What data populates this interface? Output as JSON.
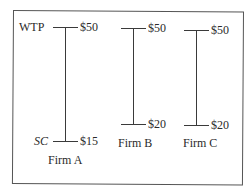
{
  "diagram": {
    "type": "willingness-to-pay-vs-supplier-cost",
    "axis_labels": {
      "top": "WTP",
      "bottom": "SC"
    },
    "firms": [
      {
        "name": "Firm A",
        "wtp": "$50",
        "sc": "$15"
      },
      {
        "name": "Firm B",
        "wtp": "$50",
        "sc": "$20"
      },
      {
        "name": "Firm C",
        "wtp": "$50",
        "sc": "$20"
      }
    ],
    "colors": {
      "line": "#3a3a3a",
      "frame": "#555555",
      "text": "#2a2a2a",
      "background": "#ffffff"
    }
  }
}
